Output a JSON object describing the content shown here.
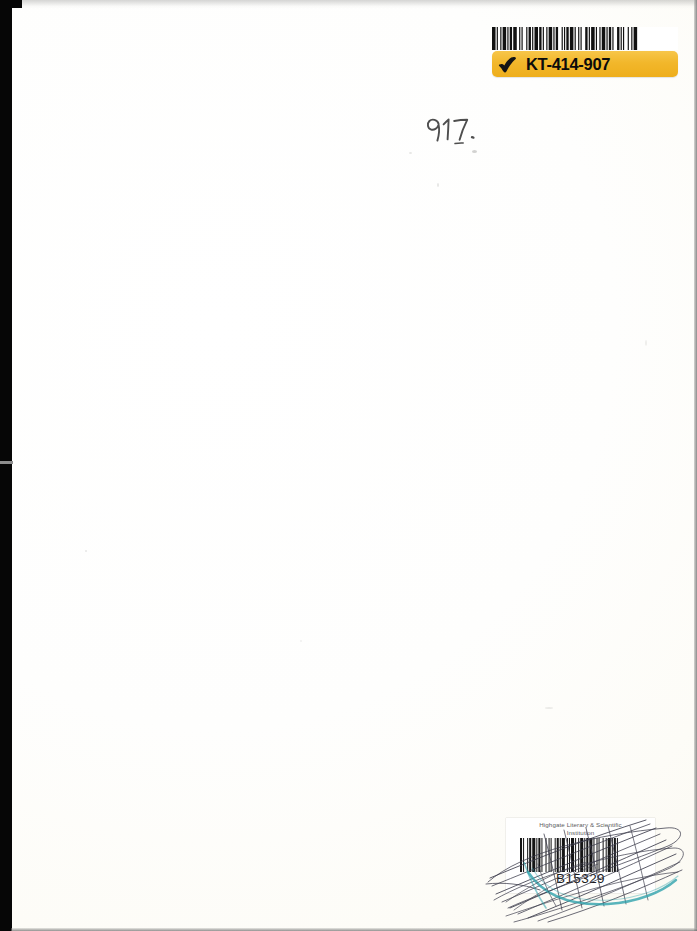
{
  "page": {
    "kind": "scanned-book-page",
    "background_color": "#fefefd",
    "scanner_bed_color": "#060606",
    "width": 697,
    "height": 931
  },
  "acquisition_label": {
    "name": "acquisition-label",
    "code": "KT-414-907",
    "band_color": "#f2b72b",
    "text_color": "#0b0b0b",
    "barcode_background": "#ffffff",
    "check_glyph": "check-mark-icon",
    "barcode_name": "acquisition-barcode",
    "barcode_bar_pattern": [
      3,
      1,
      1,
      2,
      1,
      1,
      3,
      1,
      1,
      1,
      2,
      1,
      3,
      2,
      1,
      1,
      1,
      3,
      1,
      1,
      2,
      1,
      1,
      1,
      3,
      1,
      2,
      1,
      1,
      2,
      1,
      1,
      3,
      1,
      1,
      1,
      2,
      3,
      1,
      1,
      1,
      1,
      2,
      1,
      3,
      1,
      1,
      2,
      1,
      1,
      1,
      3,
      2,
      1,
      1,
      1,
      3,
      1,
      1,
      2,
      1,
      1,
      3,
      1,
      1,
      1,
      2,
      1,
      1,
      3,
      2,
      1,
      1,
      1,
      1,
      3,
      1,
      2,
      1,
      1,
      3
    ]
  },
  "shelfmark": {
    "name": "shelfmark-handwritten",
    "value": "917.",
    "medium": "pencil",
    "ink_color": "#4a4a4a"
  },
  "library_label": {
    "name": "library-label",
    "institution_line_1": "Highgate Literary & Scientific",
    "institution_line_2": "Institution",
    "barcode_number": "B15329",
    "label_background": "#ffffff",
    "institution_text_color": "#5d5d5d",
    "number_text_color": "#1c1c1c",
    "barcode_name": "library-barcode",
    "barcode_bar_pattern": [
      2,
      1,
      1,
      3,
      1,
      1,
      2,
      1,
      3,
      1,
      1,
      1,
      2,
      1,
      1,
      3,
      1,
      2,
      1,
      1,
      1,
      3,
      1,
      1,
      2,
      1,
      1,
      1,
      3,
      2,
      1,
      1,
      1,
      1,
      3,
      1,
      1,
      2,
      1,
      1,
      3,
      1,
      1,
      1,
      2,
      1,
      3,
      1,
      1,
      2,
      1,
      1,
      1,
      3,
      1,
      2,
      1,
      1,
      3,
      1,
      1,
      1,
      2,
      1,
      1,
      3
    ],
    "cancellation": {
      "name": "cancellation-scribbles",
      "description": "Crossed out with pen strokes",
      "ink_color": "#3a3a4a"
    },
    "highlight_swoosh": {
      "name": "teal-swoosh",
      "color": "#2fa3ac"
    }
  }
}
